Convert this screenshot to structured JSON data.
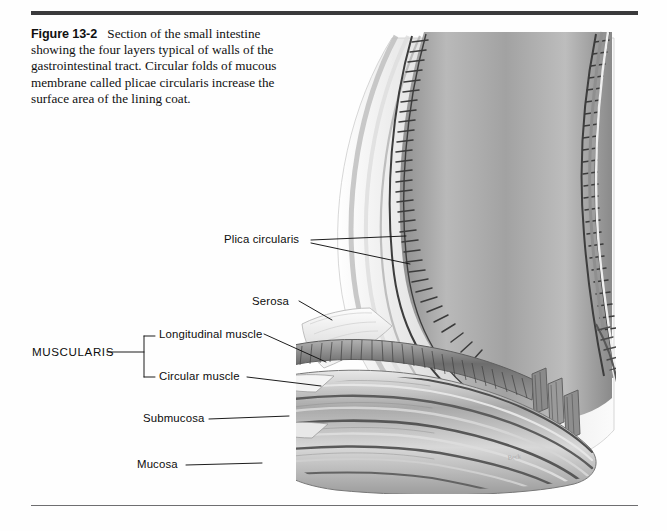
{
  "figure": {
    "number_label": "Figure 13-2",
    "caption_text": "Section of the small intestine showing the four layers typical of walls of the gastrointestinal tract. Circular folds of mucous membrane called plicae circularis increase the surface area of the lining coat.",
    "artist_signature": "Beck"
  },
  "labels": {
    "plica_circularis": "Plica circularis",
    "serosa": "Serosa",
    "muscularis": "MUSCULARIS",
    "longitudinal_muscle": "Longitudinal muscle",
    "circular_muscle": "Circular muscle",
    "submucosa": "Submucosa",
    "mucosa": "Mucosa"
  },
  "colors": {
    "rule_top": "#3a3a3c",
    "rule_bottom": "#6e6e70",
    "text": "#101010",
    "leader_line": "#111111",
    "page_background": "#fefefe",
    "illustration_light": "#f2f2f2",
    "illustration_mid": "#9a9a9a",
    "illustration_dark": "#4a4a4a"
  },
  "illustration": {
    "subject": "longitudinal section of small intestine wall",
    "style": "grayscale medical illustration",
    "layers": [
      "Mucosa",
      "Submucosa",
      "Circular muscle",
      "Longitudinal muscle",
      "Serosa"
    ]
  }
}
